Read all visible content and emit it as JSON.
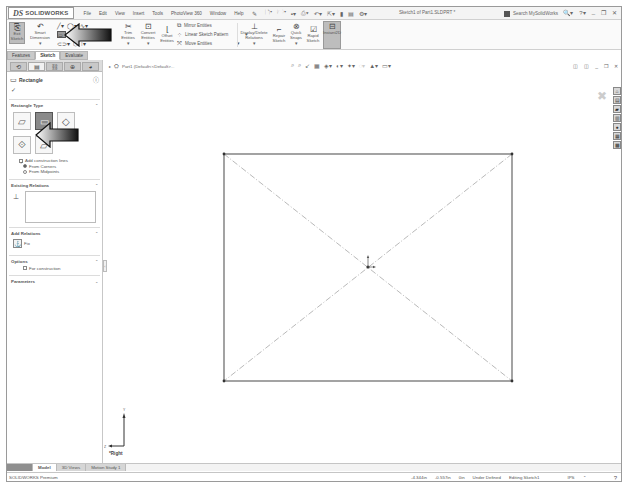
{
  "app": {
    "brand_prefix": "DS",
    "brand_name": "SOLIDWORKS",
    "menu": [
      "File",
      "Edit",
      "View",
      "Insert",
      "Tools",
      "PhotoView 360",
      "Window",
      "Help"
    ],
    "document_title": "Sketch1 of Part1.SLDPRT *",
    "search_placeholder": "Search MySolidWorks",
    "quick_access_icons": [
      "new-icon",
      "open-icon",
      "save-icon",
      "print-icon",
      "undo-icon",
      "select-icon",
      "rebuild-icon",
      "file-properties-icon",
      "options-icon"
    ]
  },
  "ribbon": {
    "buttons": [
      {
        "id": "exit-sketch",
        "label": "Exit Sketch",
        "active": true
      },
      {
        "id": "smart-dimension",
        "label": "Smart Dimension"
      },
      {
        "id": "trim-entities",
        "label": "Trim Entities"
      },
      {
        "id": "convert-entities",
        "label": "Convert Entities"
      },
      {
        "id": "offset-entities",
        "label": "Offset Entities"
      },
      {
        "id": "display-delete-relations",
        "label": "Display/Delete Relations"
      },
      {
        "id": "repair-sketch",
        "label": "Repair Sketch"
      },
      {
        "id": "quick-snaps",
        "label": "Quick Snaps"
      },
      {
        "id": "rapid-sketch",
        "label": "Rapid Sketch"
      },
      {
        "id": "instant2d",
        "label": "Instant2D",
        "active": true
      }
    ],
    "small_buttons": [
      "Mirror Entities",
      "Linear Sketch Pattern",
      "Move Entities"
    ],
    "tabs": [
      "Features",
      "Sketch",
      "Evaluate"
    ],
    "active_tab": "Sketch"
  },
  "property_manager": {
    "title": "Rectangle",
    "ok_label": "✓",
    "rectangle_type": {
      "heading": "Rectangle Type",
      "selected_index": 1,
      "types": [
        "corner-rectangle",
        "center-rectangle",
        "3-point-corner-rectangle",
        "3-point-center-rectangle",
        "parallelogram"
      ],
      "add_construction_lines": "Add construction lines",
      "from_corners": "From Corners",
      "from_midpoints": "From Midpoints",
      "selected_option": "From Corners"
    },
    "existing_relations": {
      "heading": "Existing Relations"
    },
    "add_relations": {
      "heading": "Add Relations",
      "fix_label": "Fix"
    },
    "options": {
      "heading": "Options",
      "for_construction": "For construction"
    },
    "parameters": {
      "heading": "Parameters"
    }
  },
  "graphics": {
    "breadcrumb": "Part1 (Default<<Default>...",
    "view_label": "*Right",
    "rectangle": {
      "x1": 120,
      "y1": 103,
      "x2": 408,
      "y2": 330,
      "center_x": 264,
      "center_y": 216
    }
  },
  "bottom_tabs": [
    "",
    "Model",
    "3D Views",
    "Motion Study 1"
  ],
  "status_bar": {
    "product": "SOLIDWORKS Premium",
    "x_coord": "-4.344in",
    "y_coord": "-0.557in",
    "z_coord": "0in",
    "state": "Under Defined",
    "mode": "Editing Sketch1",
    "units": "IPS"
  }
}
